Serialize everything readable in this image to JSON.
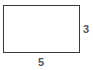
{
  "diagram": {
    "shape": "rectangle",
    "width_label": "5",
    "height_label": "3",
    "stroke_color": "#3a3a3a",
    "label_color": "#555555"
  }
}
